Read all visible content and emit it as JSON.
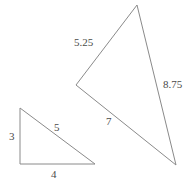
{
  "figure": {
    "type": "geometry-diagram",
    "background_color": "#ffffff",
    "stroke_color": "#8a8a8a",
    "label_color": "#4a4a4a",
    "stroke_width": 1,
    "canvas": {
      "width": 188,
      "height": 188
    },
    "shapes": [
      {
        "name": "small-triangle",
        "points": "20,108 20,164 95,164",
        "labels": [
          {
            "name": "small-triangle-label-left",
            "text": "3"
          },
          {
            "name": "small-triangle-label-hypotenuse",
            "text": "5"
          },
          {
            "name": "small-triangle-label-bottom",
            "text": "4"
          }
        ]
      },
      {
        "name": "large-triangle",
        "points": "137,5 76,85 176,165",
        "labels": [
          {
            "name": "large-triangle-label-upper-left",
            "text": "5.25"
          },
          {
            "name": "large-triangle-label-right",
            "text": "8.75"
          },
          {
            "name": "large-triangle-label-lower-left",
            "text": "7"
          }
        ]
      }
    ]
  }
}
